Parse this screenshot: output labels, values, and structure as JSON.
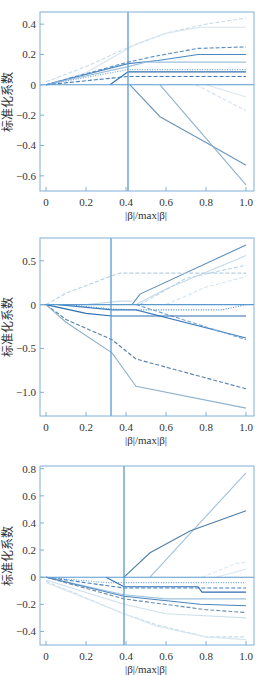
{
  "chart_data": [
    {
      "type": "line",
      "title": "",
      "xlabel": "|β|/max|β|",
      "ylabel": "标准化系数",
      "xlim": [
        -0.03,
        1.04
      ],
      "ylim": [
        -0.7,
        0.48
      ],
      "xticks": [
        0,
        0.2,
        0.4,
        0.6,
        0.8,
        1.0
      ],
      "xtick_labels": [
        "0",
        "0.2",
        "0.4",
        "0.6",
        "0.8",
        "1.0"
      ],
      "yticks": [
        0.4,
        0.2,
        0,
        -0.2,
        -0.4,
        -0.6
      ],
      "ytick_labels": [
        "0.4",
        "0.2",
        "0",
        "−0.2",
        "−0.4",
        "−0.6"
      ],
      "grid": false,
      "legend": null,
      "vline_x": 0.41,
      "hline_y": 0,
      "series": [
        {
          "name": "var1",
          "style": "dashed",
          "color": "#c8dcea",
          "x": [
            0,
            0.2,
            0.4,
            0.6,
            0.8,
            1.0
          ],
          "y": [
            0.02,
            0.12,
            0.24,
            0.34,
            0.4,
            0.44
          ]
        },
        {
          "name": "var2",
          "style": "solid",
          "color": "#d5e4ee",
          "x": [
            0,
            0.2,
            0.45,
            0.6,
            0.77,
            1.0
          ],
          "y": [
            0,
            0.08,
            0.27,
            0.34,
            0.38,
            0.38
          ]
        },
        {
          "name": "var3",
          "style": "dashed",
          "color": "#5b8fbf",
          "x": [
            0,
            0.41,
            0.55,
            0.76,
            1.0
          ],
          "y": [
            0,
            0.15,
            0.19,
            0.24,
            0.25
          ]
        },
        {
          "name": "var4",
          "style": "solid",
          "color": "#4a86c0",
          "x": [
            0,
            0.41,
            0.56,
            0.76,
            1.0
          ],
          "y": [
            0,
            0.14,
            0.16,
            0.2,
            0.2
          ]
        },
        {
          "name": "var5",
          "style": "solid",
          "color": "#9fc2df",
          "x": [
            0,
            0.41,
            0.5,
            1.0
          ],
          "y": [
            0,
            0.12,
            0.15,
            0.15
          ]
        },
        {
          "name": "var6",
          "style": "dotted",
          "color": "#6fa3d0",
          "x": [
            0,
            0.41,
            1.0
          ],
          "y": [
            0,
            0.1,
            0.1
          ]
        },
        {
          "name": "var7",
          "style": "solid",
          "color": "#2e6fb0",
          "x": [
            0.32,
            0.41,
            1.0
          ],
          "y": [
            0,
            0.085,
            0.085
          ]
        },
        {
          "name": "var8",
          "style": "dashed",
          "color": "#3f7fbf",
          "x": [
            0,
            0.41,
            1.0
          ],
          "y": [
            0,
            0.055,
            0.055
          ]
        },
        {
          "name": "var9",
          "style": "solid",
          "color": "#6b95b8",
          "x": [
            0.42,
            0.57,
            0.8,
            1.0
          ],
          "y": [
            0,
            -0.21,
            -0.38,
            -0.53
          ]
        },
        {
          "name": "var10",
          "style": "solid",
          "color": "#8fb1cd",
          "x": [
            0.57,
            1.0
          ],
          "y": [
            0,
            -0.66
          ]
        },
        {
          "name": "var11",
          "style": "dashed",
          "color": "#d3e2ee",
          "x": [
            0.75,
            1.0
          ],
          "y": [
            0,
            -0.17
          ]
        },
        {
          "name": "var12",
          "style": "solid",
          "color": "#dde9f2",
          "x": [
            0.8,
            1.0
          ],
          "y": [
            0,
            -0.08
          ]
        }
      ]
    },
    {
      "type": "line",
      "title": "",
      "xlabel": "|β|/max|β|",
      "ylabel": "标准化系数",
      "xlim": [
        -0.03,
        1.04
      ],
      "ylim": [
        -1.27,
        0.76
      ],
      "xticks": [
        0,
        0.2,
        0.4,
        0.6,
        0.8,
        1.0
      ],
      "xtick_labels": [
        "0",
        "0.2",
        "0.4",
        "0.6",
        "0.8",
        "1.0"
      ],
      "yticks": [
        0.5,
        0,
        -0.5,
        -1.0
      ],
      "ytick_labels": [
        "0.5",
        "0",
        "−0.5",
        "−1.0"
      ],
      "grid": false,
      "legend": null,
      "vline_x": 0.325,
      "hline_y": 0,
      "series": [
        {
          "name": "var1",
          "style": "solid",
          "color": "#5b8fbf",
          "x": [
            0.43,
            0.47,
            1.0
          ],
          "y": [
            0,
            0.12,
            0.68
          ]
        },
        {
          "name": "var2",
          "style": "solid",
          "color": "#c5dbeb",
          "x": [
            0.45,
            0.6,
            1.0
          ],
          "y": [
            0,
            0.18,
            0.56
          ]
        },
        {
          "name": "var3",
          "style": "dashed",
          "color": "#bcd4e7",
          "x": [
            0.47,
            0.7,
            1.0
          ],
          "y": [
            0,
            0.3,
            0.45
          ]
        },
        {
          "name": "var4",
          "style": "dashed",
          "color": "#d6e5f0",
          "x": [
            0.6,
            0.8,
            1.0
          ],
          "y": [
            0,
            0.2,
            0.32
          ]
        },
        {
          "name": "var5",
          "style": "dashed",
          "color": "#b7d0e4",
          "x": [
            0,
            0.1,
            0.33,
            0.37,
            1.0
          ],
          "y": [
            0,
            0.13,
            0.33,
            0.36,
            0.36
          ]
        },
        {
          "name": "var6",
          "style": "solid",
          "color": "#c9dcea",
          "x": [
            0.2,
            0.37,
            0.43
          ],
          "y": [
            0,
            0.04,
            0.04
          ]
        },
        {
          "name": "var7",
          "style": "dotted",
          "color": "#4a86c0",
          "x": [
            0.1,
            0.33,
            0.45,
            0.88,
            1.0
          ],
          "y": [
            0,
            -0.05,
            -0.06,
            -0.06,
            0
          ]
        },
        {
          "name": "var8",
          "style": "solid",
          "color": "#3f7fbf",
          "x": [
            0.06,
            0.33,
            0.45,
            1.0
          ],
          "y": [
            0,
            -0.06,
            -0.06,
            -0.38
          ]
        },
        {
          "name": "var9",
          "style": "dashed",
          "color": "#6fa3d0",
          "x": [
            0.45,
            1.0
          ],
          "y": [
            0,
            -0.4
          ]
        },
        {
          "name": "var10",
          "style": "solid",
          "color": "#2e6fb0",
          "x": [
            0,
            0.2,
            0.33,
            1.0
          ],
          "y": [
            0,
            -0.1,
            -0.13,
            -0.13
          ]
        },
        {
          "name": "var11",
          "style": "dashed",
          "color": "#5580aa",
          "x": [
            0,
            0.1,
            0.33,
            0.45,
            1.0
          ],
          "y": [
            0,
            -0.17,
            -0.4,
            -0.62,
            -0.96
          ]
        },
        {
          "name": "var12",
          "style": "solid",
          "color": "#8fb1cd",
          "x": [
            0,
            0.1,
            0.33,
            0.45,
            1.0
          ],
          "y": [
            0,
            -0.2,
            -0.55,
            -0.93,
            -1.18
          ]
        }
      ]
    },
    {
      "type": "line",
      "title": "",
      "xlabel": "|β|/max|β|",
      "ylabel": "标准化系数",
      "xlim": [
        -0.03,
        1.04
      ],
      "ylim": [
        -0.5,
        0.82
      ],
      "xticks": [
        0,
        0.2,
        0.4,
        0.6,
        0.8,
        1.0
      ],
      "xtick_labels": [
        "0",
        "0.2",
        "0.4",
        "0.6",
        "0.8",
        "1.0"
      ],
      "yticks": [
        0.8,
        0.6,
        0.4,
        0.2,
        0,
        -0.2,
        -0.4
      ],
      "ytick_labels": [
        "0.8",
        "0.6",
        "0.4",
        "0.2",
        "0",
        "−0.2",
        "−0.4"
      ],
      "grid": false,
      "legend": null,
      "vline_x": 0.39,
      "hline_y": 0,
      "series": [
        {
          "name": "var1",
          "style": "solid",
          "color": "#9fc2df",
          "x": [
            0.52,
            1.0
          ],
          "y": [
            0,
            0.77
          ]
        },
        {
          "name": "var2",
          "style": "solid",
          "color": "#4f7fa8",
          "x": [
            0.39,
            0.52,
            0.72,
            1.0
          ],
          "y": [
            0,
            0.18,
            0.34,
            0.49
          ]
        },
        {
          "name": "var3",
          "style": "dashed",
          "color": "#dbe8f1",
          "x": [
            0.78,
            0.95,
            1.0
          ],
          "y": [
            0,
            0.1,
            0.11
          ]
        },
        {
          "name": "var4",
          "style": "solid",
          "color": "#dde9f2",
          "x": [
            0.85,
            1.0
          ],
          "y": [
            0,
            0.06
          ]
        },
        {
          "name": "var5",
          "style": "dotted",
          "color": "#6fa3d0",
          "x": [
            0,
            0.3,
            0.39,
            1.0
          ],
          "y": [
            0,
            -0.04,
            -0.04,
            -0.04
          ]
        },
        {
          "name": "var6",
          "style": "solid",
          "color": "#2e6fb0",
          "x": [
            0.3,
            0.39,
            0.76,
            0.78,
            1.0
          ],
          "y": [
            0,
            -0.07,
            -0.07,
            -0.11,
            -0.11
          ]
        },
        {
          "name": "var7",
          "style": "dashed",
          "color": "#3f7fbf",
          "x": [
            0,
            0.39,
            1.0
          ],
          "y": [
            0,
            -0.08,
            -0.08
          ]
        },
        {
          "name": "var8",
          "style": "solid",
          "color": "#9fc2df",
          "x": [
            0,
            0.39,
            0.6,
            1.0
          ],
          "y": [
            0,
            -0.13,
            -0.16,
            -0.16
          ]
        },
        {
          "name": "var9",
          "style": "solid",
          "color": "#4a86c0",
          "x": [
            0,
            0.39,
            0.77,
            1.0
          ],
          "y": [
            0,
            -0.14,
            -0.2,
            -0.21
          ]
        },
        {
          "name": "var10",
          "style": "dashed",
          "color": "#6a8fb0",
          "x": [
            0,
            0.39,
            0.8,
            1.0
          ],
          "y": [
            0,
            -0.16,
            -0.24,
            -0.26
          ]
        },
        {
          "name": "var11",
          "style": "solid",
          "color": "#cfe0ec",
          "x": [
            0,
            0.39,
            0.6,
            1.0
          ],
          "y": [
            -0.02,
            -0.2,
            -0.27,
            -0.3
          ]
        },
        {
          "name": "var12",
          "style": "dashed",
          "color": "#c5dbeb",
          "x": [
            0,
            0.39,
            0.55,
            0.8,
            1.0
          ],
          "y": [
            -0.03,
            -0.27,
            -0.35,
            -0.44,
            -0.44
          ]
        },
        {
          "name": "var13",
          "style": "solid",
          "color": "#d8e6f0",
          "x": [
            0,
            0.39,
            0.55,
            0.8,
            1.0
          ],
          "y": [
            -0.04,
            -0.27,
            -0.36,
            -0.44,
            -0.46
          ]
        }
      ]
    }
  ],
  "panels": [
    {
      "ylabel": "标准化系数",
      "xlabel": "|β|/max|β|"
    },
    {
      "ylabel": "标准化系数",
      "xlabel": "|β|/max|β|"
    },
    {
      "ylabel": "标准化系数",
      "xlabel": "|β|/max|β|"
    }
  ],
  "colors": {
    "axis": "#7fb0d6",
    "refline": "#5a9ad0",
    "text": "#333333"
  }
}
